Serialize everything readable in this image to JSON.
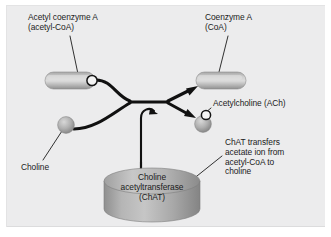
{
  "diagram": {
    "title_visible": false,
    "background_color": "#ececed",
    "stroke_color": "#111111",
    "labels": {
      "acetyl_coa": "Acetyl coenzyme A\n(acetyl-CoA)",
      "coenzyme_a": "Coenzyme A\n(CoA)",
      "acetylcholine": "Acetylcholine (ACh)",
      "chat_description": "ChAT transfers\nacetate ion from\nacetyl-CoA to\ncholine",
      "choline": "Choline",
      "enzyme": "Choline\nacetyltransferase\n(ChAT)"
    },
    "shapes": {
      "acetyl_coa_capsule": {
        "kind": "capsule",
        "fill_light": "#d0d0d0",
        "fill_dark": "#8f8f8f",
        "acetate_marker": "white-circle"
      },
      "coenzyme_a_capsule": {
        "kind": "capsule",
        "fill_light": "#d0d0d0",
        "fill_dark": "#8f8f8f",
        "acetate_marker": "none"
      },
      "choline_sphere": {
        "kind": "sphere",
        "fill_light": "#c4c4c4",
        "fill_dark": "#8a8a8a",
        "acetate_marker": "none"
      },
      "acetylcholine_sphere": {
        "kind": "sphere",
        "fill_light": "#c4c4c4",
        "fill_dark": "#8a8a8a",
        "acetate_marker": "white-circle"
      },
      "enzyme_cylinder": {
        "kind": "cylinder",
        "fill_light": "#b9b9b9",
        "fill_dark": "#808080"
      }
    },
    "arrows": {
      "reactants_merge": "acetyl-CoA and choline curve into a shared stem",
      "product_upper": "arrow to Coenzyme A",
      "product_lower": "arrow to Acetylcholine",
      "enzyme_input": "curled arrow from ChAT cylinder into reaction stem"
    }
  }
}
